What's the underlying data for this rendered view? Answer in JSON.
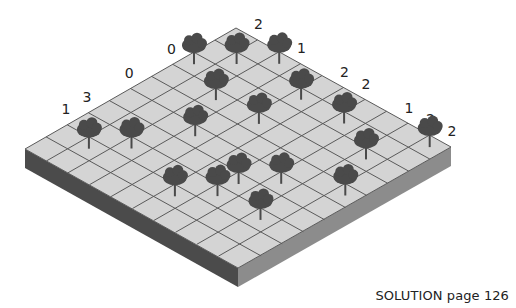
{
  "puzzle": {
    "grid_size": 10,
    "corners": {
      "top": [
        236,
        28
      ],
      "right": [
        451,
        147
      ],
      "bottom": [
        238,
        268
      ],
      "left": [
        25,
        149
      ]
    },
    "thickness": 19,
    "colors": {
      "top_surface": "#d4d4d4",
      "grid_line": "#5a5a5a",
      "left_side": "#4b4b4b",
      "right_side": "#8c8c8c",
      "tree": "#4a4a4a",
      "clue_text": "#222222"
    },
    "trees": [
      {
        "col": 0,
        "row": 2
      },
      {
        "col": 1,
        "row": 1
      },
      {
        "col": 2,
        "row": 0
      },
      {
        "col": 2,
        "row": 3
      },
      {
        "col": 4,
        "row": 1
      },
      {
        "col": 4,
        "row": 3
      },
      {
        "col": 6,
        "row": 1
      },
      {
        "col": 3,
        "row": 5
      },
      {
        "col": 1,
        "row": 8
      },
      {
        "col": 2,
        "row": 7
      },
      {
        "col": 8,
        "row": 2
      },
      {
        "col": 9,
        "row": 0
      },
      {
        "col": 7,
        "row": 5
      },
      {
        "col": 6,
        "row": 6
      },
      {
        "col": 6,
        "row": 7
      },
      {
        "col": 5,
        "row": 8
      },
      {
        "col": 9,
        "row": 4
      },
      {
        "col": 8,
        "row": 7
      }
    ],
    "row_clues": [
      {
        "row": 2,
        "value": "0"
      },
      {
        "row": 4,
        "value": "0"
      },
      {
        "row": 6,
        "value": "3"
      },
      {
        "row": 7,
        "value": "1"
      }
    ],
    "col_clues": [
      {
        "col": 0,
        "value": "2"
      },
      {
        "col": 2,
        "value": "1"
      },
      {
        "col": 4,
        "value": "2"
      },
      {
        "col": 5,
        "value": "2"
      },
      {
        "col": 7,
        "value": "1"
      },
      {
        "col": 8,
        "value": "2"
      },
      {
        "col": 9,
        "value": "2"
      }
    ]
  },
  "caption": "SOLUTION page 126"
}
